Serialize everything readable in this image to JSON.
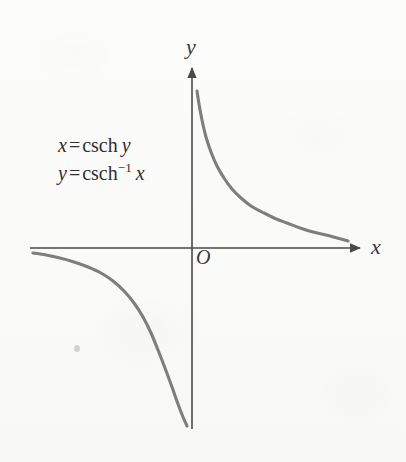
{
  "figure": {
    "kind": "math-graph",
    "background_color": "#fbfbfa",
    "axis_color": "#4a4a4a",
    "curve_color": "#7e7e7e",
    "text_color": "#2e2e2e"
  },
  "labels": {
    "y_axis": "y",
    "x_axis": "x",
    "origin": "O"
  },
  "equations": {
    "line1": {
      "lhs": "x",
      "equals": "=",
      "fn": "csch",
      "arg": "y",
      "plain": "x = csch y"
    },
    "line2": {
      "lhs": "y",
      "equals": "=",
      "fn": "csch",
      "exponent": "−1",
      "arg": "x",
      "plain": "y = csch⁻¹ x"
    }
  },
  "chart_data": {
    "type": "line",
    "title": "",
    "xlabel": "x",
    "ylabel": "y",
    "grid": false,
    "legend": false,
    "axes": {
      "origin_px": [
        192,
        248
      ],
      "x_axis_px": {
        "x_start": 30,
        "x_end": 363,
        "y": 248,
        "arrow": "right"
      },
      "y_axis_px": {
        "y_start": 65,
        "y_end": 429,
        "x": 192,
        "arrow": "up"
      }
    },
    "annotations": [
      "x = csch y",
      "y = csch⁻¹ x"
    ],
    "series": [
      {
        "name": "y = csch^-1 x  (x > 0 branch)",
        "comment": "Upper-right branch: decays from near +infinity at x->0+ toward 0 as x increases",
        "points_px": [
          [
            197,
            91
          ],
          [
            199,
            104
          ],
          [
            202,
            120
          ],
          [
            206,
            137
          ],
          [
            211,
            152
          ],
          [
            217,
            166
          ],
          [
            224,
            178
          ],
          [
            232,
            189
          ],
          [
            241,
            198
          ],
          [
            251,
            206
          ],
          [
            262,
            212
          ],
          [
            274,
            218
          ],
          [
            287,
            223
          ],
          [
            300,
            228
          ],
          [
            313,
            232
          ],
          [
            326,
            235
          ],
          [
            337,
            238
          ],
          [
            348,
            241
          ]
        ]
      },
      {
        "name": "y = csch^-1 x  (x < 0 branch)",
        "comment": "Lower-left branch: approaches 0 as x -> -infinity, plunges to -infinity as x -> 0-",
        "points_px": [
          [
            33,
            253
          ],
          [
            46,
            255
          ],
          [
            60,
            258
          ],
          [
            74,
            262
          ],
          [
            88,
            267
          ],
          [
            101,
            273
          ],
          [
            113,
            281
          ],
          [
            124,
            291
          ],
          [
            134,
            303
          ],
          [
            143,
            317
          ],
          [
            151,
            333
          ],
          [
            158,
            350
          ],
          [
            165,
            368
          ],
          [
            172,
            387
          ],
          [
            178,
            404
          ],
          [
            183,
            417
          ],
          [
            187,
            426
          ]
        ]
      }
    ]
  }
}
